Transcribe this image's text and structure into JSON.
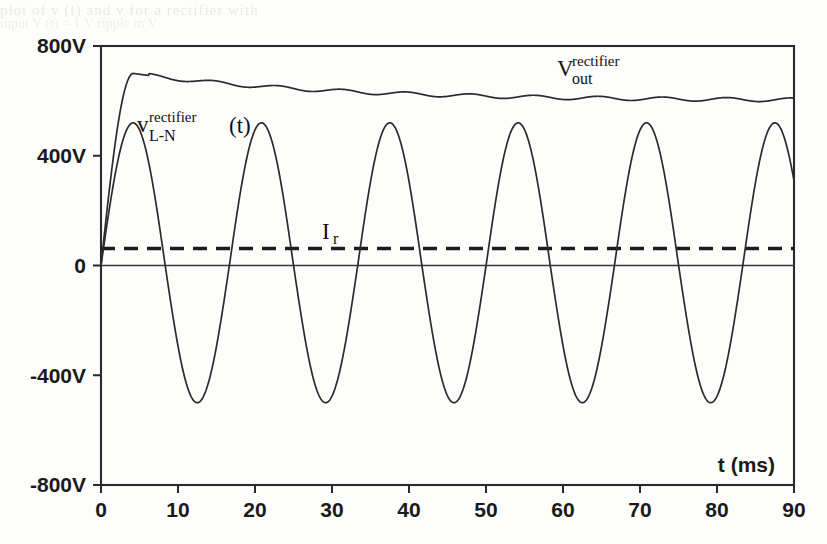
{
  "figure": {
    "background_color": "#fdfdfb",
    "ink_color": "#2b2b2b",
    "bleed_text_line1": "plot of  v   (t)  and  v       for  a  rectifier  with",
    "bleed_text_line2": "input  V  (t) = 1   V  ripple  in  V"
  },
  "axes": {
    "x_axis_label": "t (ms)",
    "y_axis_label": "",
    "x_ticks": [
      "0",
      "10",
      "20",
      "30",
      "40",
      "50",
      "60",
      "70",
      "80",
      "90"
    ],
    "x_tick_values": [
      0,
      10,
      20,
      30,
      40,
      50,
      60,
      70,
      80,
      90
    ],
    "y_ticks": [
      "800V",
      "400V",
      "0",
      "-400V",
      "-800V"
    ],
    "y_tick_values": [
      800,
      400,
      0,
      -400,
      -800
    ],
    "xlim": [
      0,
      90
    ],
    "ylim": [
      -800,
      800
    ]
  },
  "annotations": {
    "vout": {
      "base": "V",
      "superscript": "rectifier",
      "subscript": "out"
    },
    "vln": {
      "base": "v",
      "superscript": "rectifier",
      "subscript": "L-N",
      "suffix": "(t)"
    },
    "ir": {
      "base": "I",
      "subscript": "r"
    }
  },
  "chart_data": {
    "type": "line",
    "title": "",
    "xlabel": "t (ms)",
    "ylabel": "",
    "xlim": [
      0,
      90
    ],
    "ylim": [
      -800,
      800
    ],
    "xticks": [
      0,
      10,
      20,
      30,
      40,
      50,
      60,
      70,
      80,
      90
    ],
    "yticks": [
      -800,
      -400,
      0,
      400,
      800
    ],
    "grid": false,
    "legend": "inline-annotations",
    "series": [
      {
        "name": "v_L-N^rectifier (t)",
        "style": "solid",
        "description": "60 Hz line-to-neutral sinusoid, amplitude about 520 V, period about 16.7 ms, starting at 0 V at t=0",
        "amplitude": 520,
        "period_ms": 16.67,
        "frequency_hz": 60,
        "phase_deg": 0,
        "peaks_t_ms": [
          4.2,
          20.8,
          37.5,
          54.2,
          70.8,
          87.5
        ],
        "peak_value": 520,
        "troughs_t_ms": [
          12.5,
          29.2,
          45.8,
          62.5,
          79.2
        ],
        "trough_value": -500
      },
      {
        "name": "V_out^rectifier",
        "style": "solid",
        "description": "Rectifier DC output: rises rapidly from 0 V, overshoots to about 700 V near t=4 ms, then decays and settles near 600 V with a small 120 Hz ripple",
        "initial_value": 0,
        "overshoot_value": 700,
        "overshoot_t_ms": 4.2,
        "settled_value": 600,
        "ripple_peak_to_peak": 14,
        "ripple_frequency_hz": 120
      },
      {
        "name": "I_r",
        "style": "dashed",
        "description": "Horizontal dashed reference level slightly above zero",
        "value": 62,
        "constant": true
      },
      {
        "name": "zero axis",
        "style": "solid-thin",
        "value": 0,
        "constant": true
      }
    ]
  }
}
